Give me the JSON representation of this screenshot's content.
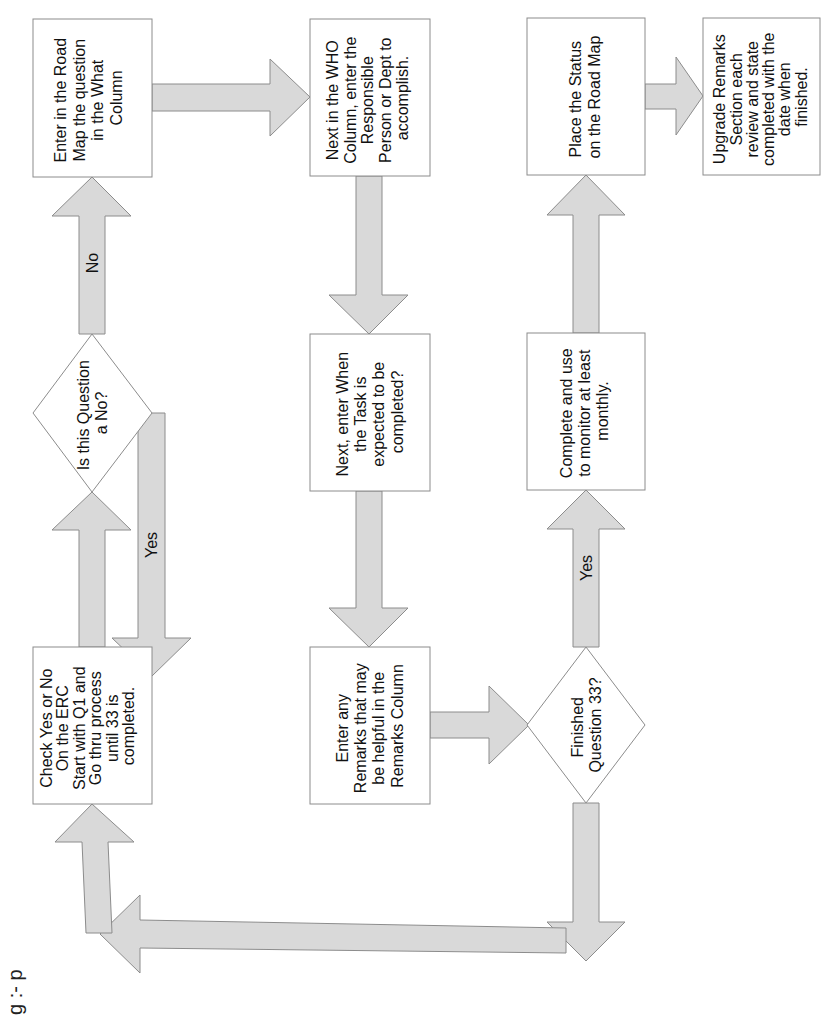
{
  "diagram": {
    "type": "flowchart",
    "orientation": "rotated -90deg (text reads bottom-to-top)",
    "colors": {
      "arrow_fill": "#d9d9d9",
      "stroke": "#8c8c8c",
      "box_fill": "#ffffff",
      "text": "#111111"
    },
    "nodes": {
      "enter_road_map": {
        "shape": "box",
        "lines": [
          "Enter in the Road",
          "Map the question",
          "in the What",
          "Column"
        ]
      },
      "is_question_no": {
        "shape": "diamond",
        "lines": [
          "Is this Question",
          "a No?"
        ]
      },
      "check_yes_no": {
        "shape": "box",
        "lines": [
          "Check Yes or No",
          "On the ERC",
          "Start with Q1  and",
          "Go thru process",
          "until 33 is",
          "completed."
        ]
      },
      "who_column": {
        "shape": "box",
        "lines": [
          "Next in the WHO",
          "Column, enter the",
          "Responsible",
          "Person or Dept to",
          "accomplish."
        ]
      },
      "when_task": {
        "shape": "box",
        "lines": [
          "Next, enter When",
          "the Task is",
          "expected to be",
          "completed?"
        ]
      },
      "enter_remarks": {
        "shape": "box",
        "lines": [
          "Enter any",
          "Remarks that may",
          "be helpful in the",
          "Remarks Column"
        ]
      },
      "place_status": {
        "shape": "box",
        "lines": [
          "Place the Status",
          "on the Road Map"
        ]
      },
      "complete_monitor": {
        "shape": "box",
        "lines": [
          "Complete and use",
          "to monitor at least",
          "monthly."
        ]
      },
      "finished_q33": {
        "shape": "diamond",
        "lines": [
          "Finished",
          "Question  33?"
        ]
      },
      "upgrade_remarks": {
        "shape": "box",
        "lines": [
          "Upgrade Remarks",
          "Section each",
          "review and state",
          "completed with the",
          "date when",
          "finished."
        ]
      }
    },
    "edges": [
      {
        "from": "check_yes_no",
        "to": "is_question_no",
        "label": ""
      },
      {
        "from": "is_question_no",
        "to": "enter_road_map",
        "label": "No"
      },
      {
        "from": "is_question_no",
        "to": "check_yes_no",
        "label": "Yes"
      },
      {
        "from": "enter_road_map",
        "to": "who_column",
        "label": ""
      },
      {
        "from": "who_column",
        "to": "when_task",
        "label": ""
      },
      {
        "from": "when_task",
        "to": "enter_remarks",
        "label": ""
      },
      {
        "from": "enter_remarks",
        "to": "finished_q33",
        "label": ""
      },
      {
        "from": "finished_q33",
        "to": "complete_monitor",
        "label": "Yes"
      },
      {
        "from": "finished_q33",
        "to": "check_yes_no",
        "label": ""
      },
      {
        "from": "complete_monitor",
        "to": "place_status",
        "label": ""
      },
      {
        "from": "place_status",
        "to": "upgrade_remarks",
        "label": ""
      }
    ],
    "edge_labels": {
      "no": "No",
      "yes_loop": "Yes",
      "yes_finished": "Yes"
    },
    "corner_fragment": "g :- p"
  }
}
